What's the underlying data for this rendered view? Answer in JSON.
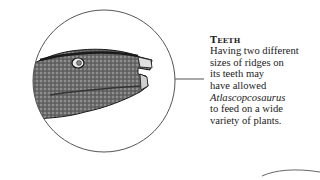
{
  "caption": {
    "heading": "Teeth",
    "lines": [
      "Having two different",
      "sizes of ridges on",
      "its teeth may",
      "have allowed",
      "Atlascopcosaurus",
      "to feed on a wide",
      "variety of plants."
    ],
    "italic_term": "Atlascopcosaurus"
  },
  "illustration": {
    "subject": "Atlascopcosaurus head close-up",
    "frame": "circle",
    "line_color": "#555555"
  }
}
